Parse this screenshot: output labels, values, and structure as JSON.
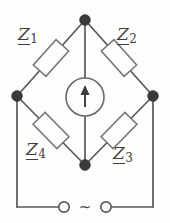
{
  "figure": {
    "background_color": "#fdfdfc",
    "line_color": "#59595b",
    "node_color": "#3a3a3c"
  },
  "components": {
    "z1": {
      "symbol": "Z",
      "subscript": "1",
      "name": "impedance-z1",
      "arm": "top-left"
    },
    "z2": {
      "symbol": "Z",
      "subscript": "2",
      "name": "impedance-z2",
      "arm": "top-right"
    },
    "z3": {
      "symbol": "Z",
      "subscript": "3",
      "name": "impedance-z3",
      "arm": "bottom-right"
    },
    "z4": {
      "symbol": "Z",
      "subscript": "4",
      "name": "impedance-z4",
      "arm": "bottom-left"
    }
  },
  "detector": {
    "label": "",
    "symbol": "arrow-up",
    "type": "galvanometer"
  },
  "source": {
    "symbol": "~",
    "type": "ac-source",
    "terminal_left": "",
    "terminal_right": ""
  },
  "nodes": {
    "top": {
      "x": 85,
      "y": 20
    },
    "left": {
      "x": 17,
      "y": 96
    },
    "right": {
      "x": 153,
      "y": 96
    },
    "bottom": {
      "x": 85,
      "y": 165
    }
  }
}
